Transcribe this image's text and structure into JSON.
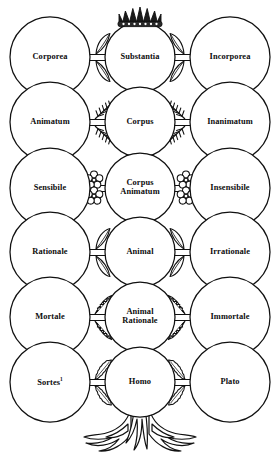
{
  "diagram": {
    "ink_color": "#111111",
    "background_color": "#ffffff",
    "ornament_top": "crown-icon",
    "ornament_bottom": "roots-icon"
  },
  "rows": [
    {
      "left": {
        "label": "Corporea",
        "cx": 50,
        "cy": 57,
        "r": 40
      },
      "center": {
        "label": "Substantia",
        "cx": 140,
        "cy": 57,
        "r": 35
      },
      "right": {
        "label": "Incorporea",
        "cx": 230,
        "cy": 57,
        "r": 40
      },
      "foliage": "pointed-leaf-icon"
    },
    {
      "left": {
        "label": "Animatum",
        "cx": 50,
        "cy": 122,
        "r": 40
      },
      "center": {
        "label": "Corpus",
        "cx": 140,
        "cy": 122,
        "r": 35
      },
      "right": {
        "label": "Inanimatum",
        "cx": 230,
        "cy": 122,
        "r": 40
      },
      "foliage": "fern-leaf-icon"
    },
    {
      "left": {
        "label": "Sensibile",
        "cx": 50,
        "cy": 188,
        "r": 40
      },
      "center": {
        "label": "Corpus\nAnimatum",
        "cx": 140,
        "cy": 188,
        "r": 35
      },
      "right": {
        "label": "Insensibile",
        "cx": 230,
        "cy": 188,
        "r": 40
      },
      "foliage": "clover-flower-icon"
    },
    {
      "left": {
        "label": "Rationale",
        "cx": 50,
        "cy": 252,
        "r": 40
      },
      "center": {
        "label": "Animal",
        "cx": 140,
        "cy": 252,
        "r": 35
      },
      "right": {
        "label": "Irrationale",
        "cx": 230,
        "cy": 252,
        "r": 40
      },
      "foliage": "pointed-leaf-icon"
    },
    {
      "left": {
        "label": "Mortale",
        "cx": 50,
        "cy": 317,
        "r": 40
      },
      "center": {
        "label": "Animal\nRationale",
        "cx": 140,
        "cy": 317,
        "r": 35
      },
      "right": {
        "label": "Immortale",
        "cx": 230,
        "cy": 317,
        "r": 40
      },
      "foliage": "serrated-leaf-icon"
    },
    {
      "left": {
        "label": "Sortes",
        "sup": "1",
        "cx": 50,
        "cy": 382,
        "r": 40
      },
      "center": {
        "label": "Homo",
        "cx": 140,
        "cy": 382,
        "r": 35
      },
      "right": {
        "label": "Plato",
        "cx": 230,
        "cy": 382,
        "r": 40
      },
      "foliage": "oak-leaf-icon"
    }
  ]
}
